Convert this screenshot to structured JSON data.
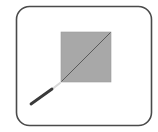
{
  "icon": {
    "name": "slice-square-tool-icon",
    "colors": {
      "frame_stroke": "#4a4a4a",
      "frame_fill": "#ffffff",
      "square_fill": "#a8a8a8",
      "square_stroke": "#9a9a9a",
      "diagonal": "#5a5a5a",
      "pen_body": "#3a3a3a",
      "pen_tip": "#d8d8d8"
    }
  }
}
